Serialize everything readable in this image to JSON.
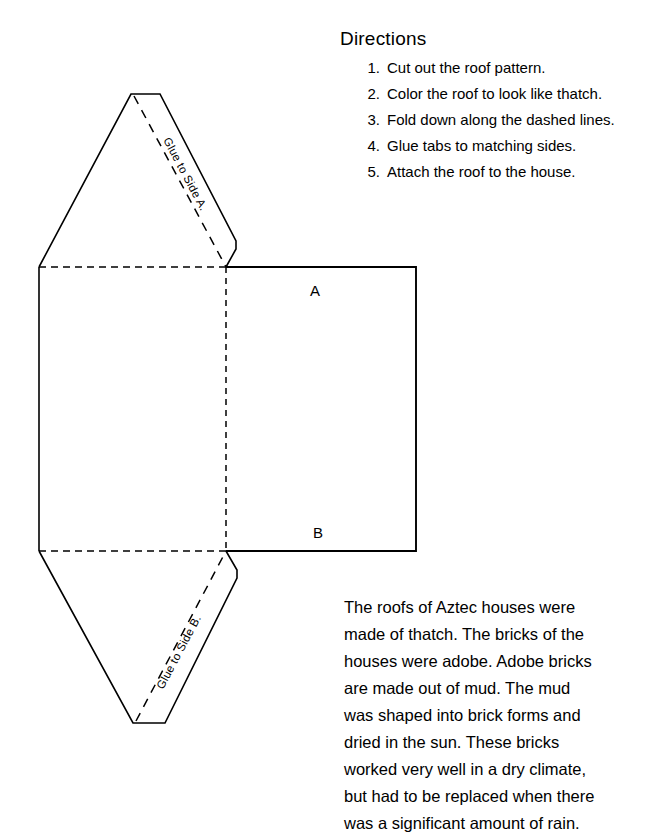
{
  "page": {
    "background_color": "#ffffff",
    "ink_color": "#000000",
    "width": 666,
    "height": 838
  },
  "directions": {
    "title": "Directions",
    "items": [
      {
        "number": "1.",
        "text": "Cut out the roof pattern."
      },
      {
        "number": "2.",
        "text": "Color the roof to look like thatch."
      },
      {
        "number": "3.",
        "text": "Fold down along the dashed lines."
      },
      {
        "number": "4.",
        "text": "Glue tabs to matching sides."
      },
      {
        "number": "5.",
        "text": "Attach the roof to the house."
      }
    ]
  },
  "diagram": {
    "name": "roof-pattern-template",
    "side_label_a": "A",
    "side_label_b": "B",
    "tab_top_label": "Glue to Side A.",
    "tab_bottom_label": "Glue to Side B.",
    "line_color": "#000000",
    "fold_line_style": "dashed"
  },
  "info_paragraph": {
    "text": "The roofs of Aztec houses were\nmade of thatch.  The bricks of the\nhouses were adobe.  Adobe bricks\nare made out of mud.  The mud\nwas shaped into brick forms and\ndried in the sun.  These bricks\nworked very well in a dry climate,\nbut had to be replaced when there\nwas a significant amount of rain."
  }
}
